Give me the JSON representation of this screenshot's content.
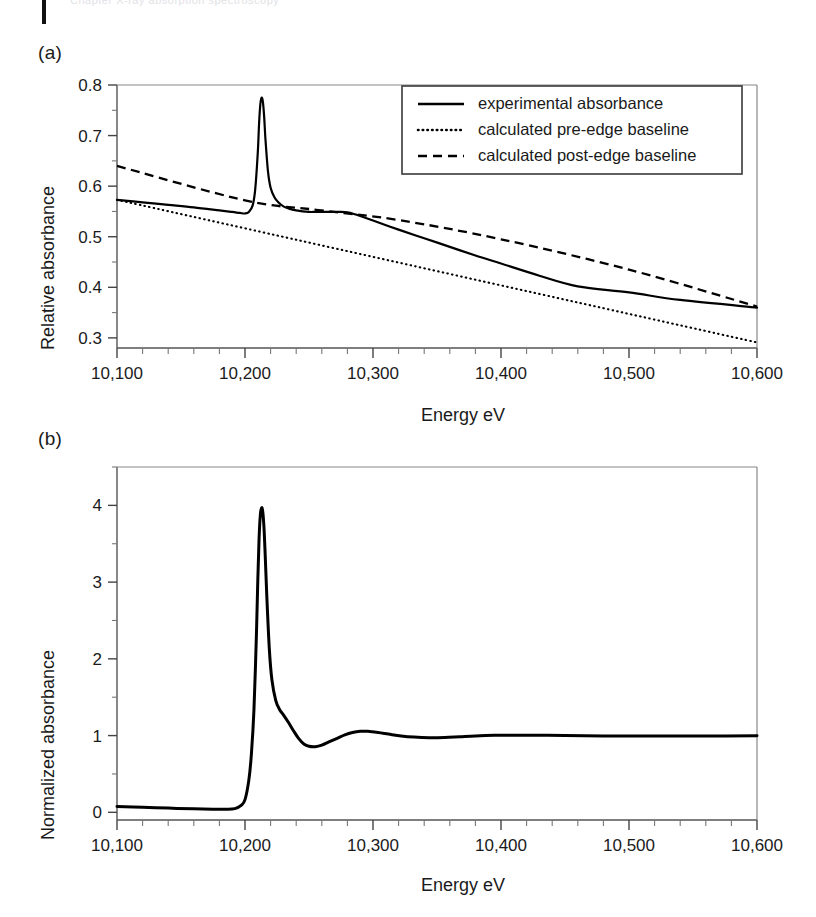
{
  "page": {
    "header_ghost_text": "Chapter X-ray absorption spectroscopy"
  },
  "figure": {
    "panels": [
      {
        "label": "(a)",
        "ylabel": "Relative absorbance",
        "xlabel": "Energy eV"
      },
      {
        "label": "(b)",
        "ylabel": "Normalized absorbance",
        "xlabel": "Energy eV"
      }
    ]
  },
  "legend": {
    "position": "upper-right",
    "entries": [
      {
        "label": "experimental absorbance",
        "style": "solid"
      },
      {
        "label": "calculated pre-edge baseline",
        "style": "dotted"
      },
      {
        "label": "calculated post-edge baseline",
        "style": "dashed"
      }
    ]
  },
  "chart_data": [
    {
      "type": "line",
      "panel": "(a)",
      "title": "",
      "xlabel": "Energy eV",
      "ylabel": "Relative absorbance",
      "xlim": [
        10100,
        10600
      ],
      "ylim": [
        0.28,
        0.8
      ],
      "xticks": [
        10100,
        10200,
        10300,
        10400,
        10500,
        10600
      ],
      "xticklabels": [
        "10,100",
        "10,200",
        "10,300",
        "10,400",
        "10,500",
        "10,600"
      ],
      "yticks": [
        0.3,
        0.4,
        0.5,
        0.6,
        0.7,
        0.8
      ],
      "yticklabels": [
        "0.3",
        "0.4",
        "0.5",
        "0.6",
        "0.7",
        "0.8"
      ],
      "minor_xtick_interval": 20,
      "minor_ytick_interval": 0.05,
      "grid": false,
      "legend": [
        "experimental absorbance",
        "calculated pre-edge baseline",
        "calculated post-edge baseline"
      ],
      "series": [
        {
          "name": "experimental absorbance",
          "style": "solid",
          "color": "#000000",
          "x": [
            10100,
            10120,
            10140,
            10160,
            10180,
            10190,
            10196,
            10200,
            10203,
            10206,
            10208,
            10210,
            10211,
            10212,
            10213,
            10214,
            10215,
            10216,
            10218,
            10220,
            10223,
            10226,
            10230,
            10235,
            10240,
            10245,
            10250,
            10255,
            10260,
            10265,
            10270,
            10275,
            10280,
            10285,
            10290,
            10300,
            10320,
            10340,
            10360,
            10380,
            10400,
            10430,
            10460,
            10500,
            10540,
            10600
          ],
          "y": [
            0.573,
            0.568,
            0.563,
            0.558,
            0.552,
            0.549,
            0.547,
            0.546,
            0.549,
            0.562,
            0.594,
            0.667,
            0.724,
            0.762,
            0.775,
            0.766,
            0.736,
            0.692,
            0.628,
            0.597,
            0.578,
            0.568,
            0.56,
            0.555,
            0.552,
            0.55,
            0.549,
            0.549,
            0.549,
            0.549,
            0.549,
            0.549,
            0.548,
            0.545,
            0.541,
            0.532,
            0.514,
            0.497,
            0.48,
            0.463,
            0.447,
            0.423,
            0.402,
            0.39,
            0.375,
            0.36
          ]
        },
        {
          "name": "calculated pre-edge baseline",
          "style": "dotted",
          "color": "#000000",
          "x": [
            10100,
            10600
          ],
          "y": [
            0.573,
            0.291
          ]
        },
        {
          "name": "calculated post-edge baseline",
          "style": "dashed",
          "color": "#000000",
          "x": [
            10100,
            10200,
            10260,
            10320,
            10400,
            10500,
            10600
          ],
          "y": [
            0.64,
            0.572,
            0.552,
            0.533,
            0.495,
            0.435,
            0.362
          ]
        }
      ],
      "annotations": {
        "edge_energy_eV": 10213,
        "white_line_peak_value": 0.775,
        "pre_edge_departure_eV": 10200
      }
    },
    {
      "type": "line",
      "panel": "(b)",
      "title": "",
      "xlabel": "Energy eV",
      "ylabel": "Normalized absorbance",
      "xlim": [
        10100,
        10600
      ],
      "ylim": [
        -0.1,
        4.5
      ],
      "xticks": [
        10100,
        10200,
        10300,
        10400,
        10500,
        10600
      ],
      "xticklabels": [
        "10,100",
        "10,200",
        "10,300",
        "10,400",
        "10,500",
        "10,600"
      ],
      "yticks": [
        0,
        1,
        2,
        3,
        4
      ],
      "yticklabels": [
        "0",
        "1",
        "2",
        "3",
        "4"
      ],
      "minor_xtick_interval": 20,
      "minor_ytick_interval": 0.5,
      "grid": false,
      "legend": [],
      "series": [
        {
          "name": "normalized absorbance",
          "style": "solid",
          "color": "#000000",
          "x": [
            10100,
            10120,
            10140,
            10160,
            10175,
            10185,
            10192,
            10197,
            10200,
            10203,
            10205,
            10207,
            10209,
            10210,
            10211,
            10212,
            10213,
            10214,
            10215,
            10216,
            10217,
            10219,
            10221,
            10224,
            10227,
            10230,
            10234,
            10238,
            10242,
            10246,
            10250,
            10255,
            10260,
            10266,
            10272,
            10278,
            10284,
            10290,
            10296,
            10304,
            10312,
            10322,
            10332,
            10344,
            10356,
            10368,
            10380,
            10395,
            10410,
            10430,
            10450,
            10480,
            10520,
            10560,
            10600
          ],
          "y": [
            0.075,
            0.065,
            0.055,
            0.045,
            0.04,
            0.04,
            0.048,
            0.09,
            0.165,
            0.42,
            0.76,
            1.34,
            2.36,
            3.02,
            3.57,
            3.88,
            3.97,
            3.9,
            3.66,
            3.26,
            2.83,
            2.13,
            1.73,
            1.46,
            1.34,
            1.27,
            1.17,
            1.06,
            0.96,
            0.89,
            0.86,
            0.855,
            0.875,
            0.92,
            0.965,
            1.01,
            1.04,
            1.055,
            1.055,
            1.04,
            1.02,
            0.995,
            0.98,
            0.972,
            0.975,
            0.985,
            0.995,
            1.003,
            1.006,
            1.005,
            1.0,
            0.996,
            0.994,
            0.995,
            0.997
          ]
        }
      ],
      "annotations": {
        "edge_energy_eV": 10213,
        "white_line_peak_value": 3.97,
        "post_edge_normalization_value": 1.0
      }
    }
  ]
}
